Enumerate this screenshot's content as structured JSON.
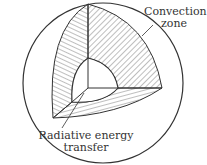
{
  "diagram": {
    "title": "",
    "labels": {
      "convection_line1": "Convection",
      "convection_line2": "zone",
      "radiative_line1": "Radiative energy",
      "radiative_line2": "transfer"
    },
    "colors": {
      "stroke": "#333333",
      "hatch": "#444444",
      "background": "#ffffff"
    }
  }
}
